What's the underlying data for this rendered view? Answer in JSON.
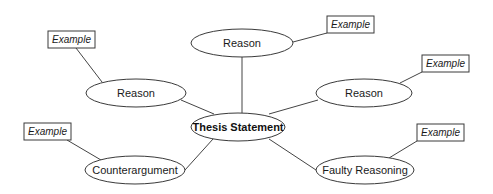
{
  "diagram": {
    "center": {
      "label": "Thesis Statement"
    },
    "nodes": [
      {
        "id": "reason-top",
        "label": "Reason"
      },
      {
        "id": "reason-left",
        "label": "Reason"
      },
      {
        "id": "reason-right",
        "label": "Reason"
      },
      {
        "id": "counterargument",
        "label": "Counterargument"
      },
      {
        "id": "faulty-reasoning",
        "label": "Faulty Reasoning"
      }
    ],
    "examples": [
      {
        "attached_to": "reason-left",
        "label": "Example"
      },
      {
        "attached_to": "reason-top",
        "label": "Example"
      },
      {
        "attached_to": "reason-right",
        "label": "Example"
      },
      {
        "attached_to": "counterargument",
        "label": "Example"
      },
      {
        "attached_to": "faulty-reasoning",
        "label": "Example"
      }
    ]
  }
}
